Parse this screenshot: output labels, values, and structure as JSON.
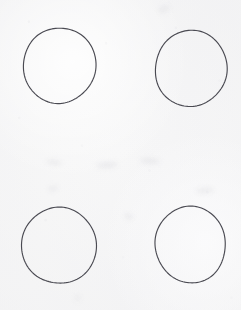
{
  "sheet": {
    "label": "Scanned paper sheet",
    "width": 241,
    "height": 310,
    "background_color": "#f8f8f8",
    "ink_color": "#4a4a52",
    "medium": "pen on paper",
    "caption": ""
  },
  "figure": {
    "title": "",
    "shape_count": 4,
    "grid": {
      "rows": 2,
      "columns": 2
    }
  },
  "shapes": [
    {
      "id": "circle-top-left",
      "name": "circle",
      "row": 1,
      "column": 1,
      "center_x": 59.5,
      "center_y": 65.5,
      "radius_x": 36.5,
      "radius_y": 37.5,
      "rotation": -3,
      "stroke_width": 1.15,
      "stroke_color": "#4a4a52",
      "fill": "none"
    },
    {
      "id": "circle-top-right",
      "name": "circle",
      "row": 1,
      "column": 2,
      "center_x": 191.0,
      "center_y": 68.5,
      "radius_x": 35.5,
      "radius_y": 38.5,
      "rotation": 2,
      "stroke_width": 1.15,
      "stroke_color": "#4a4a52",
      "fill": "none"
    },
    {
      "id": "circle-bottom-left",
      "name": "circle",
      "row": 2,
      "column": 1,
      "center_x": 59.0,
      "center_y": 245.5,
      "radius_x": 37.0,
      "radius_y": 38.5,
      "rotation": -2,
      "stroke_width": 1.15,
      "stroke_color": "#4a4a52",
      "fill": "none"
    },
    {
      "id": "circle-bottom-right",
      "name": "circle",
      "row": 2,
      "column": 2,
      "center_x": 190.5,
      "center_y": 244.5,
      "radius_x": 35.0,
      "radius_y": 38.5,
      "rotation": 3,
      "stroke_width": 1.15,
      "stroke_color": "#4a4a52",
      "fill": "none"
    }
  ],
  "marks": [
    {
      "id": "smudge-upper-right",
      "name": "faint-smudge"
    },
    {
      "id": "smudge-mid-left",
      "name": "faint-smudge"
    },
    {
      "id": "smudge-mid-center",
      "name": "faint-smudge"
    },
    {
      "id": "smudge-mid-right",
      "name": "faint-smudge"
    },
    {
      "id": "smudge-lower-left",
      "name": "faint-smudge"
    },
    {
      "id": "smudge-lower-mid",
      "name": "faint-smudge"
    },
    {
      "id": "smudge-bottom",
      "name": "faint-smudge"
    },
    {
      "id": "smudge-right-edge",
      "name": "faint-smudge"
    }
  ]
}
